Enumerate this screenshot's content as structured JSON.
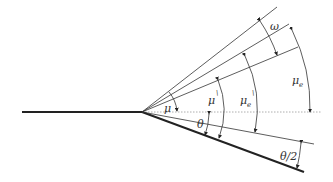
{
  "diagram": {
    "labels": {
      "omega": "ω",
      "mu": "μ",
      "mu_prime": "μ",
      "mu_prime_mark": "\\",
      "mu_e_prime": "μ",
      "mu_e_prime_sub": "e",
      "mu_e_prime_mark": "\\",
      "mu_e": "μ",
      "mu_e_sub": "e",
      "theta": "θ",
      "theta_half": "θ/2"
    },
    "colors": {
      "line": "#222222",
      "dotted": "#888888",
      "background": "#ffffff"
    }
  }
}
